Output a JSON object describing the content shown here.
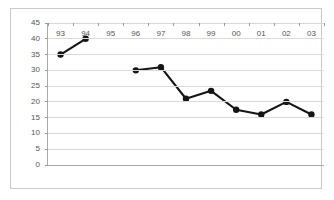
{
  "chart_data": {
    "type": "line",
    "title": "",
    "subtitle": "",
    "xlabel": "",
    "ylabel": "",
    "categories": [
      "93",
      "94",
      "95",
      "96",
      "97",
      "98",
      "99",
      "00",
      "01",
      "02",
      "03"
    ],
    "values": [
      35,
      40,
      null,
      30,
      31,
      21,
      23.5,
      17.5,
      16,
      20,
      16
    ],
    "series": [
      {
        "name": "",
        "values": [
          35,
          40,
          null,
          30,
          31,
          21,
          23.5,
          17.5,
          16,
          20,
          16
        ]
      }
    ],
    "ylim": [
      0,
      45
    ],
    "ytick_labels": [
      "45",
      "40",
      "35",
      "30",
      "25",
      "20",
      "15",
      "10",
      "5",
      "0"
    ],
    "ytick_values": [
      45,
      40,
      35,
      30,
      25,
      20,
      15,
      10,
      5,
      0
    ],
    "grid": true,
    "grid_axis": "y",
    "legend": false,
    "legend_position": "none",
    "marker": "circle",
    "has_gap": true,
    "gap_categories": [
      "95"
    ],
    "colors": {
      "series": "#151515",
      "grid": "#d9d9d9",
      "axis": "#aaaaaa",
      "frame": "#c9c9c9",
      "tick_text": "#555555",
      "background": "#ffffff"
    }
  }
}
